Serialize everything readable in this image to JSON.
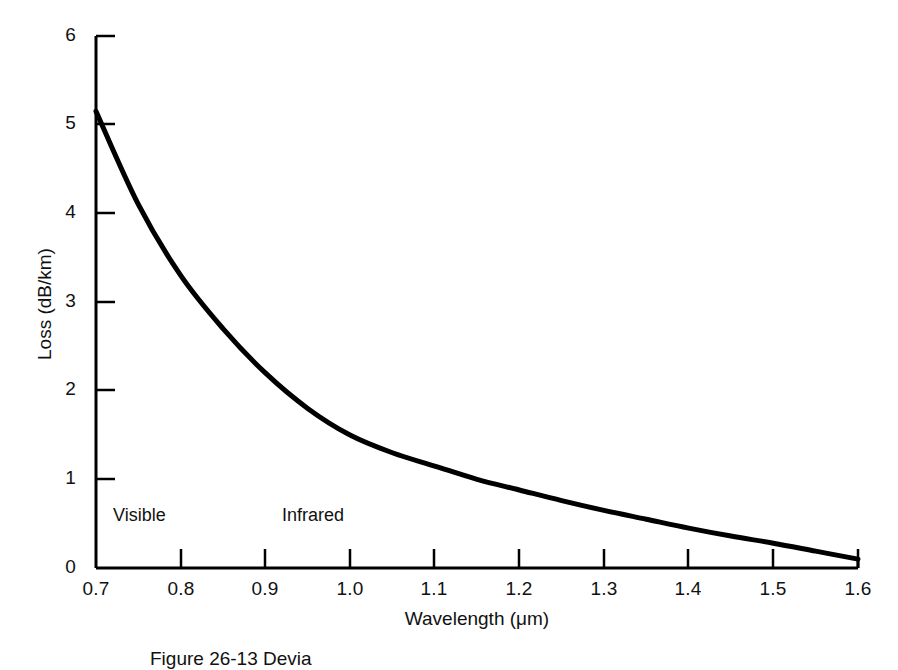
{
  "chart_data": {
    "type": "line",
    "title": "",
    "xlabel": "Wavelength (μm)",
    "ylabel": "Loss (dB/km)",
    "xlim": [
      0.7,
      1.6
    ],
    "ylim": [
      0,
      6
    ],
    "grid": false,
    "legend": "none",
    "xticks": [
      "0.7",
      "0.8",
      "0.9",
      "1.0",
      "1.1",
      "1.2",
      "1.3",
      "1.4",
      "1.5",
      "1.6"
    ],
    "yticks": [
      "0",
      "1",
      "2",
      "3",
      "4",
      "5",
      "6"
    ],
    "x": [
      0.7,
      0.75,
      0.8,
      0.85,
      0.9,
      0.95,
      1.0,
      1.05,
      1.1,
      1.15,
      1.2,
      1.25,
      1.3,
      1.35,
      1.4,
      1.45,
      1.5,
      1.55,
      1.6
    ],
    "series": [
      {
        "name": "Fiber attenuation",
        "values": [
          5.15,
          4.1,
          3.3,
          2.7,
          2.2,
          1.8,
          1.5,
          1.3,
          1.15,
          1.0,
          0.88,
          0.76,
          0.65,
          0.55,
          0.45,
          0.36,
          0.28,
          0.19,
          0.1
        ]
      }
    ],
    "annotations": [
      {
        "text": "Visible",
        "x": 0.735,
        "y": 0.6
      },
      {
        "text": "Infrared",
        "x": 0.935,
        "y": 0.6
      }
    ]
  },
  "figure": {
    "caption": "Figure 26-13   Devia"
  },
  "axis_titles": {
    "x": "Wavelength (μm)",
    "y": "Loss (dB/km)"
  },
  "colors": {
    "curve": "#000000",
    "axis": "#000000",
    "text": "#111111",
    "background": "#ffffff"
  }
}
